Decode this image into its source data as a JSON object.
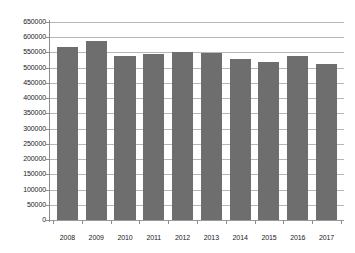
{
  "chart_data": {
    "type": "bar",
    "title": "",
    "subtitle": "",
    "xlabel": "",
    "ylabel": "",
    "categories": [
      "2008",
      "2009",
      "2010",
      "2011",
      "2012",
      "2013",
      "2014",
      "2015",
      "2016",
      "2017"
    ],
    "values": [
      568000,
      588000,
      540000,
      545000,
      550000,
      548000,
      530000,
      520000,
      538000,
      512000
    ],
    "series": [
      {
        "name": "",
        "values": [
          568000,
          588000,
          540000,
          545000,
          550000,
          548000,
          530000,
          520000,
          538000,
          512000
        ]
      }
    ],
    "ylim": [
      0,
      650000
    ],
    "ytick_step": 50000,
    "ytick_labels": [
      "0",
      "50000",
      "100000",
      "150000",
      "200000",
      "250000",
      "300000",
      "350000",
      "400000",
      "450000",
      "500000",
      "550000",
      "600000",
      "650000"
    ],
    "ytick_values": [
      0,
      50000,
      100000,
      150000,
      200000,
      250000,
      300000,
      350000,
      400000,
      450000,
      500000,
      550000,
      600000,
      650000
    ],
    "grid": true,
    "grid_axis": "y",
    "legend": false,
    "legend_position": "none",
    "bar_color": "#6e6e6e",
    "gridline_color": "#b7b7b7",
    "axis_color": "#8d8d8d",
    "background_color": "#ffffff",
    "text_color": "#1a1a1a"
  }
}
